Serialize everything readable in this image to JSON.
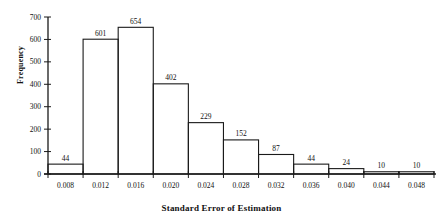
{
  "chart_data": {
    "type": "bar",
    "title": "",
    "xlabel": "Standard Error of Estimation",
    "ylabel": "Frequency",
    "categories": [
      "0.008",
      "0.012",
      "0.016",
      "0.020",
      "0.024",
      "0.028",
      "0.032",
      "0.036",
      "0.040",
      "0.044",
      "0.048"
    ],
    "values": [
      44,
      601,
      654,
      402,
      229,
      152,
      87,
      44,
      24,
      10,
      10
    ],
    "bar_labels": [
      "44",
      "601",
      "654",
      "402",
      "229",
      "152",
      "87",
      "44",
      "24",
      "10",
      "10"
    ],
    "ylim": [
      0,
      700
    ],
    "ytick_labels": [
      "0",
      "100",
      "200",
      "300",
      "400",
      "500",
      "600",
      "700"
    ],
    "ytick_values": [
      0,
      100,
      200,
      300,
      400,
      500,
      600,
      700
    ],
    "xtick_labels": [
      "0.008",
      "0.012",
      "0.016",
      "0.020",
      "0.024",
      "0.028",
      "0.032",
      "0.036",
      "0.040",
      "0.044",
      "0.048"
    ],
    "grid": false,
    "legend": "none",
    "bin_width": 0.004,
    "bar_style": "outline",
    "colors": {
      "line": "#1a1a1a",
      "text": "#111111",
      "background": "#ffffff"
    }
  }
}
